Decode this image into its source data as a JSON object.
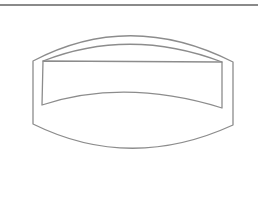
{
  "figure": {
    "stroke_color": "#8c8c8c",
    "rule_color": "#8a8a8a",
    "background": "#ffffff"
  }
}
